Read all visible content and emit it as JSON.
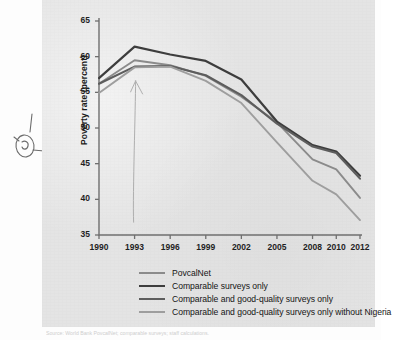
{
  "figure": {
    "background_color": "#e4e4e4",
    "page_color": "#fdfdfd",
    "bottom_caption": "Source: World Bank PovcalNet; comparable surveys; staff calculations."
  },
  "annotation": {
    "margin_mark": "handwritten-pen-mark"
  },
  "axes": {
    "y_title": "Poverty rate (percent)",
    "y_ticks": [
      "65",
      "60",
      "55",
      "50",
      "45",
      "40",
      "35"
    ],
    "x_ticks": [
      "1990",
      "1993",
      "1996",
      "1999",
      "2002",
      "2005",
      "2008",
      "2010",
      "2012"
    ]
  },
  "legend": {
    "items": [
      {
        "label": "PovcalNet",
        "color": "#8b8b8b"
      },
      {
        "label": "Comparable surveys only",
        "color": "#3d3d3d"
      },
      {
        "label": "Comparable and good-quality surveys only",
        "color": "#5d5d5d"
      },
      {
        "label": "Comparable and good-quality surveys only without Nigeria",
        "color": "#9e9e9e"
      }
    ]
  },
  "chart_data": {
    "type": "line",
    "title": "",
    "xlabel": "",
    "ylabel": "Poverty rate (percent)",
    "xlim": [
      1990,
      2012
    ],
    "ylim": [
      35,
      65
    ],
    "ytick_step": 5,
    "grid": false,
    "legend_position": "below",
    "x": [
      1990,
      1993,
      1996,
      1999,
      2002,
      2005,
      2008,
      2010,
      2012
    ],
    "series": [
      {
        "name": "PovcalNet",
        "color": "#8b8b8b",
        "width": 1.9,
        "values": [
          56.2,
          59.5,
          58.8,
          57.3,
          54.4,
          50.8,
          45.6,
          44.2,
          40.2
        ]
      },
      {
        "name": "Comparable surveys only",
        "color": "#3d3d3d",
        "width": 2.2,
        "values": [
          57.0,
          61.4,
          60.3,
          59.4,
          56.8,
          50.9,
          47.6,
          46.7,
          43.3
        ]
      },
      {
        "name": "Comparable and good-quality surveys only",
        "color": "#5d5d5d",
        "width": 2.1,
        "values": [
          56.2,
          58.6,
          58.7,
          57.4,
          54.6,
          50.6,
          47.4,
          46.5,
          42.9
        ]
      },
      {
        "name": "Comparable and good-quality surveys only without Nigeria",
        "color": "#9e9e9e",
        "width": 1.9,
        "values": [
          54.9,
          58.5,
          58.6,
          56.6,
          53.5,
          48.0,
          42.6,
          40.7,
          37.1
        ]
      }
    ],
    "annotation_stray_line": {
      "description": "faint vertical pen stroke with arrowhead near 1993",
      "x_year": 1993,
      "y_from": 36.8,
      "y_to": 56.6
    }
  }
}
